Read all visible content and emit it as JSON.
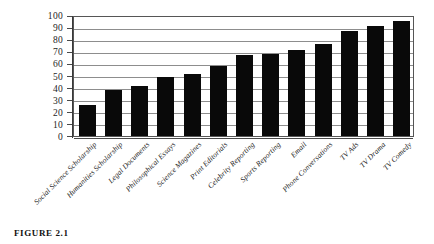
{
  "figure": {
    "caption": "FIGURE 2.1"
  },
  "chart_data": {
    "type": "bar",
    "title": "",
    "xlabel": "",
    "ylabel": "",
    "ylim": [
      0,
      100
    ],
    "ytick_step": 10,
    "grid": true,
    "legend": "none",
    "bar_color": "#090909",
    "categories": [
      "Social Science Scholarship",
      "Humanities Scholarship",
      "Legal Documents",
      "Philosophical Essays",
      "Science Magazines",
      "Print Editorials",
      "Celebrity Reporting",
      "Sports Reporting",
      "Email",
      "Phone Conversations",
      "TV Ads",
      "TV Drama",
      "TV Comedy"
    ],
    "values": [
      26,
      38,
      41,
      49,
      51,
      58,
      67,
      68,
      71,
      76,
      87,
      91,
      95
    ],
    "yticks": [
      0,
      10,
      20,
      30,
      40,
      50,
      60,
      70,
      80,
      90,
      100
    ],
    "ytick_labels": [
      "0",
      "10",
      "20",
      "30",
      "40",
      "50",
      "60",
      "70",
      "80",
      "90",
      "100"
    ]
  }
}
